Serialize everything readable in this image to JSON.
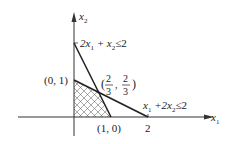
{
  "diagram": {
    "type": "linear-programming-feasible-region",
    "axes": {
      "x_label": "x",
      "x_sub": "1",
      "y_label": "x",
      "y_sub": "2"
    },
    "constraints": [
      {
        "id": "c1",
        "text_parts": [
          "2x",
          "1",
          " + x",
          "2",
          "≤2"
        ],
        "display": "2x₁ + x₂ ≤ 2",
        "endpoints": [
          [
            0,
            2
          ],
          [
            1,
            0
          ]
        ]
      },
      {
        "id": "c2",
        "text_parts": [
          "x",
          "1",
          " +2x",
          "2",
          "≤2"
        ],
        "display": "x₁ + 2x₂ ≤ 2",
        "endpoints": [
          [
            0,
            1
          ],
          [
            2,
            0
          ]
        ]
      }
    ],
    "points": [
      {
        "label": "(0, 1)",
        "coords": [
          0,
          1
        ]
      },
      {
        "label": "(1, 0)",
        "coords": [
          1,
          0
        ]
      },
      {
        "label": "2",
        "coords": [
          2,
          0
        ]
      },
      {
        "label": "(2/3, 2/3)",
        "coords": [
          0.6667,
          0.6667
        ]
      }
    ],
    "intersection": {
      "num1": "2",
      "den1": "3",
      "num2": "2",
      "den2": "3"
    },
    "feasible_region": {
      "vertices": [
        [
          0,
          0
        ],
        [
          1,
          0
        ],
        [
          0.6667,
          0.6667
        ],
        [
          0,
          1
        ]
      ],
      "fill": "crosshatch"
    },
    "colors": {
      "line": "#222222",
      "axis": "#333333",
      "hatch": "#444444"
    }
  }
}
